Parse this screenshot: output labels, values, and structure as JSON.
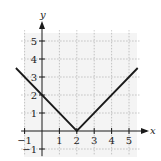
{
  "chart_data": {
    "type": "line",
    "title": "",
    "function": "y = |x - 2|",
    "xlabel": "x",
    "ylabel": "y",
    "xlim": [
      -1.2,
      5.6
    ],
    "ylim": [
      -1.3,
      5.6
    ],
    "xticks": [
      -1,
      1,
      2,
      3,
      4,
      5
    ],
    "yticks": [
      -1,
      1,
      2,
      3,
      4,
      5
    ],
    "grid": true,
    "legend": null,
    "series": [
      {
        "name": "y = |x - 2|",
        "x": [
          -1.5,
          2,
          5.5
        ],
        "y": [
          3.5,
          0,
          3.5
        ]
      }
    ]
  },
  "colors": {
    "line": "#1a1a1a",
    "axis": "#1a1a1a",
    "grid": "#b5b5b5",
    "background": "#f2f2f2"
  }
}
